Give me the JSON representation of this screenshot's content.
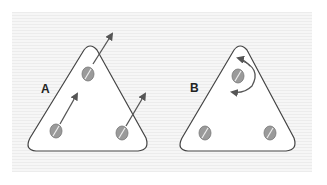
{
  "figure": {
    "panels": [
      {
        "id": "A",
        "label": "A",
        "description": "Triangular plate with three screws; arrows indicate linear translation of each screw"
      },
      {
        "id": "B",
        "label": "B",
        "description": "Triangular plate with three screws; curved double arrow indicates rotation about top screw"
      }
    ],
    "colors": {
      "background_stripe_dark": "#ececec",
      "background_stripe_light": "#f6f6f6",
      "plate_fill": "#ffffff",
      "outline": "#444444",
      "screw_fill": "#9a9a9a",
      "arrow": "#555555"
    }
  }
}
